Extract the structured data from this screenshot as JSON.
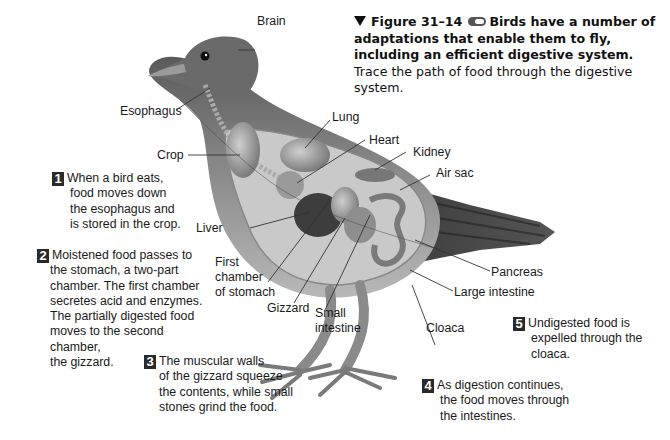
{
  "caption": {
    "figure_number": "Figure 31–14",
    "bold_text": "Birds have a number of adaptations that enable them to fly, including an efficient digestive system.",
    "regular_text": "Trace the path of food through the digestive system.",
    "icons": [
      "triangle-marker-icon",
      "media-link-icon"
    ]
  },
  "labels": {
    "brain": "Brain",
    "esophagus": "Esophagus",
    "lung": "Lung",
    "heart": "Heart",
    "crop": "Crop",
    "kidney": "Kidney",
    "air_sac": "Air sac",
    "liver": "Liver",
    "first_chamber_l1": "First",
    "first_chamber_l2": "chamber",
    "first_chamber_l3": "of stomach",
    "gizzard": "Gizzard",
    "small_intestine_l1": "Small",
    "small_intestine_l2": "intestine",
    "pancreas": "Pancreas",
    "large_intestine": "Large intestine",
    "cloaca": "Cloaca"
  },
  "steps": [
    {
      "number": "1",
      "lines": [
        "When a bird eats,",
        "food moves down",
        "the esophagus and",
        "is stored in the crop."
      ]
    },
    {
      "number": "2",
      "lines": [
        "Moistened food passes to",
        "the stomach, a two-part",
        "chamber. The first chamber",
        "secretes acid and enzymes.",
        "The partially digested food",
        "moves to the second chamber,",
        "the gizzard."
      ]
    },
    {
      "number": "3",
      "lines": [
        "The muscular walls",
        "of the gizzard squeeze",
        "the contents, while small",
        "stones grind the food."
      ]
    },
    {
      "number": "4",
      "lines": [
        "As digestion continues,",
        "the food moves through",
        "the intestines."
      ]
    },
    {
      "number": "5",
      "lines": [
        "Undigested food is",
        "expelled through the",
        "cloaca."
      ]
    }
  ]
}
